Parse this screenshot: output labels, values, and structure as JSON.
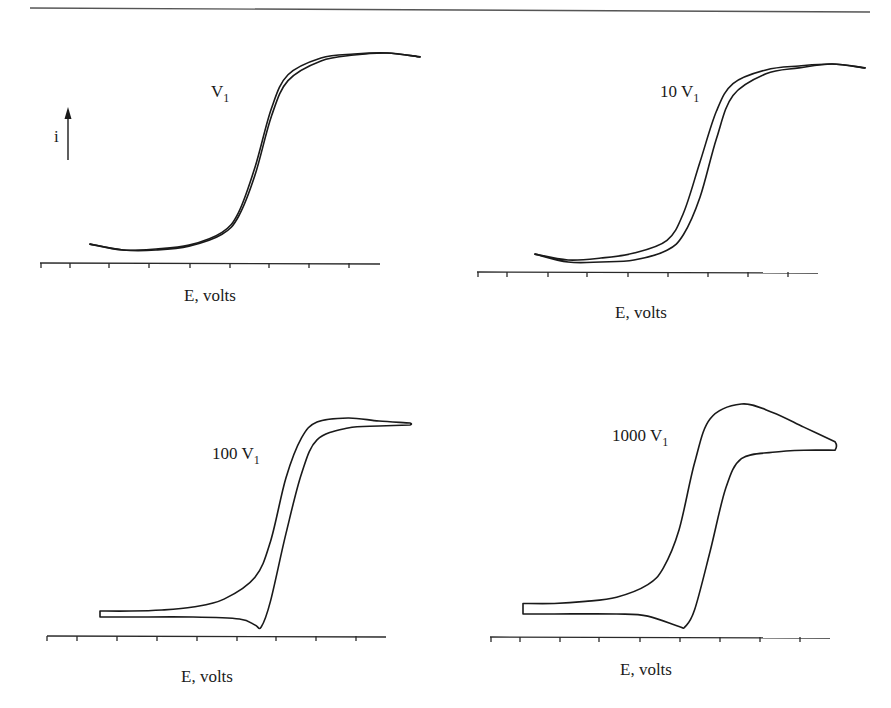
{
  "chart_data": [
    {
      "type": "line",
      "title": "",
      "panel_label": {
        "main": "V",
        "sub": "1"
      },
      "scan_rate_multiplier": 1,
      "xlabel": "E, volts",
      "ylabel": "i",
      "x_ticks": 9,
      "tick_labels": [],
      "grid": false,
      "description": "Steady-state sigmoidal voltammogram; forward and reverse scans nearly overlap",
      "series": [
        {
          "name": "forward scan",
          "x": [
            0.0,
            0.1,
            0.2,
            0.3,
            0.4,
            0.45,
            0.5,
            0.55,
            0.6,
            0.7,
            0.8,
            0.9,
            1.0
          ],
          "y": [
            0.03,
            0.0,
            0.0,
            0.02,
            0.08,
            0.17,
            0.38,
            0.68,
            0.86,
            0.96,
            0.99,
            1.0,
            0.98
          ]
        },
        {
          "name": "reverse scan",
          "x": [
            1.0,
            0.9,
            0.8,
            0.7,
            0.6,
            0.55,
            0.5,
            0.45,
            0.4,
            0.3,
            0.2,
            0.1,
            0.0
          ],
          "y": [
            0.98,
            1.0,
            0.995,
            0.975,
            0.89,
            0.72,
            0.42,
            0.19,
            0.09,
            0.025,
            0.005,
            0.0,
            0.03
          ]
        }
      ]
    },
    {
      "type": "line",
      "title": "",
      "panel_label": {
        "main": "10 V",
        "sub": "1"
      },
      "scan_rate_multiplier": 10,
      "xlabel": "E, volts",
      "ylabel": "",
      "x_ticks": 9,
      "tick_labels": [],
      "grid": false,
      "description": "Sigmoidal voltammogram with slight hysteresis between scans",
      "series": [
        {
          "name": "forward scan",
          "x": [
            0.0,
            0.1,
            0.2,
            0.3,
            0.4,
            0.45,
            0.5,
            0.55,
            0.6,
            0.7,
            0.8,
            0.9,
            1.0
          ],
          "y": [
            0.03,
            -0.01,
            -0.01,
            0.0,
            0.05,
            0.13,
            0.32,
            0.62,
            0.84,
            0.95,
            0.98,
            1.0,
            0.98
          ]
        },
        {
          "name": "reverse scan",
          "x": [
            1.0,
            0.9,
            0.8,
            0.7,
            0.6,
            0.55,
            0.5,
            0.45,
            0.4,
            0.3,
            0.2,
            0.1,
            0.0
          ],
          "y": [
            0.98,
            1.0,
            0.99,
            0.97,
            0.9,
            0.76,
            0.5,
            0.24,
            0.1,
            0.035,
            0.01,
            0.0,
            0.03
          ]
        }
      ]
    },
    {
      "type": "line",
      "title": "",
      "panel_label": {
        "main": "100 V",
        "sub": "1"
      },
      "scan_rate_multiplier": 100,
      "xlabel": "E, volts",
      "ylabel": "",
      "x_ticks": 9,
      "tick_labels": [],
      "grid": false,
      "description": "Voltammogram with pronounced hysteresis; small cathodic dip on return scan",
      "series": [
        {
          "name": "forward scan",
          "x": [
            0.0,
            0.1,
            0.2,
            0.3,
            0.4,
            0.5,
            0.55,
            0.6,
            0.65,
            0.7,
            0.8,
            0.9,
            1.0
          ],
          "y": [
            0.03,
            0.03,
            0.035,
            0.05,
            0.09,
            0.2,
            0.38,
            0.7,
            0.9,
            0.98,
            1.0,
            0.985,
            0.975
          ]
        },
        {
          "name": "reverse scan",
          "x": [
            1.0,
            0.9,
            0.8,
            0.7,
            0.65,
            0.6,
            0.55,
            0.52,
            0.5,
            0.45,
            0.3,
            0.1,
            0.0
          ],
          "y": [
            0.965,
            0.96,
            0.95,
            0.89,
            0.72,
            0.42,
            0.08,
            -0.05,
            -0.04,
            -0.01,
            0.0,
            0.0,
            0.0
          ]
        }
      ]
    },
    {
      "type": "line",
      "title": "",
      "panel_label": {
        "main": "1000 V",
        "sub": "1"
      },
      "scan_rate_multiplier": 1000,
      "xlabel": "E, volts",
      "ylabel": "",
      "x_ticks": 8,
      "tick_labels": [],
      "grid": false,
      "description": "Peak-shaped voltammogram with large hysteresis; anodic peak and cathodic dip",
      "series": [
        {
          "name": "forward scan",
          "x": [
            0.0,
            0.1,
            0.2,
            0.3,
            0.4,
            0.45,
            0.5,
            0.55,
            0.6,
            0.7,
            0.8,
            0.9,
            1.0
          ],
          "y": [
            0.05,
            0.05,
            0.06,
            0.08,
            0.14,
            0.22,
            0.4,
            0.72,
            0.93,
            1.0,
            0.96,
            0.89,
            0.82
          ]
        },
        {
          "name": "reverse scan",
          "x": [
            1.0,
            0.9,
            0.8,
            0.7,
            0.65,
            0.6,
            0.55,
            0.52,
            0.5,
            0.4,
            0.3,
            0.1,
            0.0
          ],
          "y": [
            0.78,
            0.78,
            0.77,
            0.74,
            0.6,
            0.3,
            0.02,
            -0.06,
            -0.06,
            -0.01,
            0.0,
            0.0,
            0.0
          ]
        }
      ]
    }
  ]
}
